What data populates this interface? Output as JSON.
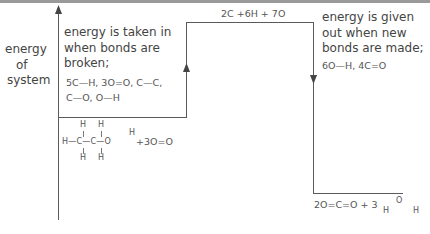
{
  "diagram": {
    "type": "energy-level-diagram",
    "axis_label": [
      "energy",
      "of",
      "system"
    ],
    "reactants": {
      "molecule": {
        "top_h": [
          "H",
          "H"
        ],
        "main_row": "H—C—C—O",
        "hydroxyl_h": "H",
        "bottom_h": [
          "H",
          "H"
        ]
      },
      "plus_oxygen": "+3O=O"
    },
    "intermediate": "2C +6H + 7O",
    "bond_breaking": {
      "lines": [
        "energy is taken in",
        "when bonds are",
        "broken;"
      ],
      "bonds": [
        "5C—H, 3O=O, C—C,",
        "C—O,  O—H"
      ]
    },
    "bond_making": {
      "lines": [
        "energy is given",
        "out when new",
        "bonds are made;"
      ],
      "bonds": "6O—H, 4C=O"
    },
    "products": {
      "co2": "2O=C=O + 3",
      "water": {
        "o": "O",
        "h1": "H",
        "h2": "H"
      }
    }
  }
}
